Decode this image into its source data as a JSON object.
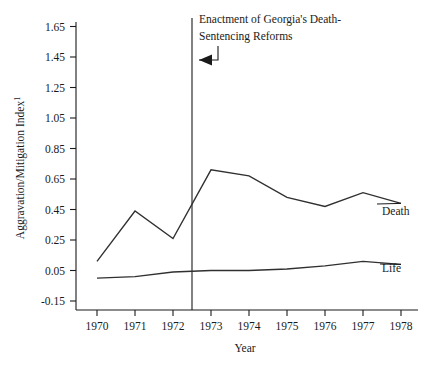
{
  "chart_data": {
    "type": "line",
    "title": "",
    "xlabel": "Year",
    "ylabel": "Aggravation/Mitigation Index",
    "ylabel_footnote": "1",
    "x": [
      1970,
      1971,
      1972,
      1973,
      1974,
      1975,
      1976,
      1977,
      1978
    ],
    "xtick_labels": [
      "1970",
      "1971",
      "1972",
      "1973",
      "1974",
      "1975",
      "1976",
      "1977",
      "1978"
    ],
    "ytick_labels": [
      "1.65",
      "1.45",
      "1.25",
      "1.05",
      "0.85",
      "0.65",
      "0.45",
      "0.25",
      "0.05",
      "-0.15"
    ],
    "ytick_values": [
      1.65,
      1.45,
      1.25,
      1.05,
      0.85,
      0.65,
      0.45,
      0.25,
      0.05,
      -0.15
    ],
    "ylim": [
      -0.15,
      1.65
    ],
    "xlim": [
      1970,
      1978
    ],
    "grid": false,
    "legend_position": "right-inline",
    "series": [
      {
        "name": "Death",
        "label": "Death",
        "values": [
          0.11,
          0.44,
          0.26,
          0.71,
          0.67,
          0.53,
          0.47,
          0.56,
          0.49
        ]
      },
      {
        "name": "Life",
        "label": "Life",
        "values": [
          0.0,
          0.01,
          0.04,
          0.05,
          0.05,
          0.06,
          0.08,
          0.11,
          0.09
        ]
      }
    ],
    "annotations": [
      {
        "name": "georgia-reform-event",
        "text_line1": "Enactment of Georgia's Death-",
        "text_line2": "Sentencing Reforms",
        "event_x": 1972.5,
        "marker": "vertical-line-with-arrow"
      }
    ]
  },
  "colors": {
    "line": "#303030",
    "axis": "#1a1a1a",
    "background": "#ffffff"
  }
}
